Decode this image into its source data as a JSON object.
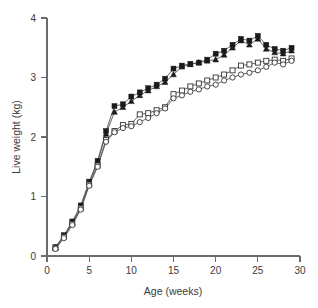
{
  "chart_data": {
    "type": "line",
    "title": "",
    "xlabel": "Age (weeks)",
    "ylabel": "Live weight (kg)",
    "xlim": [
      0,
      30
    ],
    "ylim": [
      0,
      4
    ],
    "xticks": [
      0,
      5,
      10,
      15,
      20,
      25,
      30
    ],
    "yticks": [
      0,
      1,
      2,
      3,
      4
    ],
    "xtick_labels": [
      "0",
      "5",
      "10",
      "15",
      "20",
      "25",
      "30"
    ],
    "ytick_labels": [
      "0",
      "1",
      "2",
      "3",
      "4"
    ],
    "grid": false,
    "legend": "none",
    "x": [
      1,
      2,
      3,
      4,
      5,
      6,
      7,
      8,
      9,
      10,
      11,
      12,
      13,
      14,
      15,
      16,
      17,
      18,
      19,
      20,
      21,
      22,
      23,
      24,
      25,
      26,
      27,
      28,
      29
    ],
    "series": [
      {
        "name": "series-filled-square",
        "marker": "filled-square",
        "values": [
          0.15,
          0.35,
          0.58,
          0.85,
          1.25,
          1.6,
          2.1,
          2.52,
          2.55,
          2.68,
          2.75,
          2.82,
          2.88,
          2.98,
          3.15,
          3.2,
          3.23,
          3.25,
          3.3,
          3.4,
          3.45,
          3.55,
          3.65,
          3.62,
          3.7,
          3.55,
          3.48,
          3.45,
          3.5
        ]
      },
      {
        "name": "series-filled-triangle",
        "marker": "filled-triangle",
        "values": [
          0.14,
          0.33,
          0.56,
          0.82,
          1.22,
          1.58,
          2.05,
          2.42,
          2.5,
          2.6,
          2.7,
          2.78,
          2.85,
          2.92,
          3.05,
          3.18,
          3.22,
          3.25,
          3.28,
          3.3,
          3.38,
          3.5,
          3.62,
          3.55,
          3.65,
          3.48,
          3.42,
          3.4,
          3.45
        ]
      },
      {
        "name": "series-open-square",
        "marker": "open-square",
        "values": [
          0.13,
          0.32,
          0.54,
          0.8,
          1.2,
          1.52,
          1.95,
          2.1,
          2.2,
          2.22,
          2.38,
          2.4,
          2.45,
          2.5,
          2.72,
          2.78,
          2.85,
          2.9,
          2.95,
          3.0,
          3.05,
          3.12,
          3.2,
          3.22,
          3.25,
          3.28,
          3.3,
          3.28,
          3.32
        ]
      },
      {
        "name": "series-open-circle",
        "marker": "open-circle",
        "values": [
          0.12,
          0.3,
          0.52,
          0.78,
          1.18,
          1.5,
          1.92,
          2.08,
          2.15,
          2.18,
          2.25,
          2.32,
          2.4,
          2.48,
          2.65,
          2.7,
          2.76,
          2.8,
          2.85,
          2.88,
          2.95,
          3.0,
          3.05,
          3.08,
          3.12,
          3.18,
          3.25,
          3.22,
          3.28
        ]
      }
    ]
  },
  "axes": {
    "x_title": "Age (weeks)",
    "y_title": "Live weight (kg)"
  }
}
